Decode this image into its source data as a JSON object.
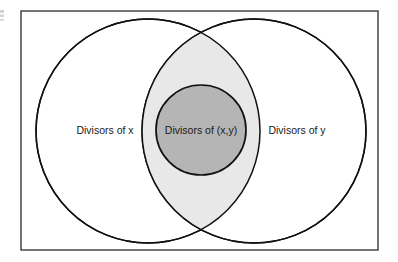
{
  "figure": {
    "type": "venn-diagram",
    "background_color": "#ffffff",
    "border": {
      "color": "#3a3a3a",
      "stroke_width": 1.4,
      "x": 21,
      "y": 11,
      "width": 357,
      "height": 239
    },
    "regions": {
      "left": {
        "label": "Divisors of x",
        "fill": "#ffffff",
        "stroke": "#111111",
        "center_x": 148,
        "center_y": 131,
        "radius": 112,
        "label_x": 105,
        "label_y": 131
      },
      "right": {
        "label": "Divisors of y",
        "fill": "#ffffff",
        "stroke": "#111111",
        "center_x": 254,
        "center_y": 131,
        "radius": 112,
        "label_x": 297,
        "label_y": 131
      },
      "intersection_lens": {
        "fill": "#e8e8e8",
        "stroke": "#111111",
        "top_vertex_x": 201,
        "top_vertex_y": 38,
        "bottom_vertex_x": 201,
        "bottom_vertex_y": 223
      },
      "inner": {
        "label": "Divisors of (x,y)",
        "fill": "#b5b5b5",
        "stroke": "#111111",
        "center_x": 201,
        "center_y": 130,
        "radius": 45,
        "label_x": 201,
        "label_y": 131
      }
    },
    "colors": {
      "border_gray": "#3a3a3a",
      "circle_stroke": "#111111",
      "lens_light_gray": "#e8e8e8",
      "inner_medium_gray": "#b5b5b5",
      "text_color": "#1a1a1a",
      "page_white": "#ffffff"
    }
  }
}
